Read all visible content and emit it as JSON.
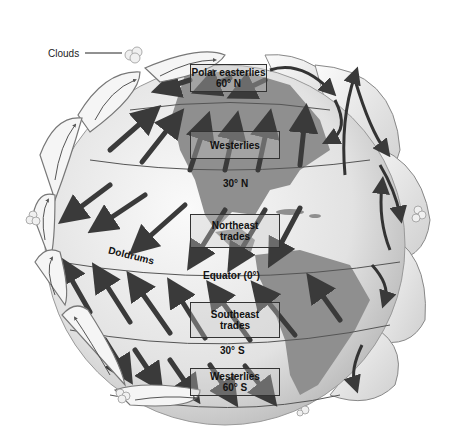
{
  "diagram": {
    "callout": {
      "label": "Clouds"
    },
    "wind_belts": [
      {
        "name": "Polar easterlies",
        "latitude": "60° N"
      },
      {
        "name": "Westerlies",
        "latitude": "30° N"
      },
      {
        "name": "Northeast trades",
        "latitude": ""
      },
      {
        "name": "Southeast trades",
        "latitude": "30° S"
      },
      {
        "name": "Westerlies",
        "latitude": "60° S"
      }
    ],
    "labels": {
      "polar_easterlies": "Polar easterlies",
      "lat_60n": "60° N",
      "westerlies_n": "Westerlies",
      "lat_30n": "30° N",
      "ne_trades_1": "Northeast",
      "ne_trades_2": "trades",
      "doldrums": "Doldrums",
      "equator": "Equator (0°)",
      "se_trades_1": "Southeast",
      "se_trades_2": "trades",
      "lat_30s": "30° S",
      "westerlies_s": "Westerlies",
      "lat_60s": "60° S",
      "clouds": "Clouds"
    },
    "colors": {
      "globe": "#e6e6e6",
      "land": "#8f8f8f",
      "arrow": "#3a3a3a",
      "cell": "#f2f2f2",
      "cell_outline": "#6a6a6a",
      "line": "#555555"
    }
  }
}
